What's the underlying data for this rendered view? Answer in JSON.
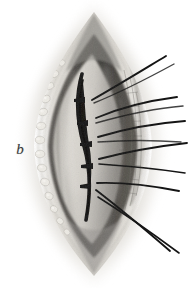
{
  "figure": {
    "kind": "medical-illustration",
    "technique": "monochrome halftone engraving",
    "panel_label": "b",
    "background_color": "#ffffff",
    "width": 188,
    "height": 288
  },
  "palette": {
    "background": "#ffffff",
    "thread_black": "#141414",
    "incision_dark": "#1c1c1c",
    "cavity_shadow": "#3b3a38",
    "tissue_mid": "#8e8c88",
    "tissue_light": "#d8d5cf",
    "tissue_highlight": "#f2f0ec",
    "fat_lobule": "#e9e6e0",
    "outer_fade": "#c9c6c0",
    "label_ink": "#3a3a3a"
  },
  "anatomy": {
    "wound_outline": {
      "name": "lens-shaped wound opening",
      "apex_top": [
        94,
        12
      ],
      "apex_bottom": [
        94,
        276
      ],
      "left_extreme": [
        34,
        144
      ],
      "right_extreme": [
        150,
        144
      ]
    },
    "regions": [
      {
        "name": "outer-skin-margin",
        "shade": "#d0cdc7",
        "note": "soft feathered halftone fading to white"
      },
      {
        "name": "subcutaneous-fat-left",
        "shade": "#e9e6e0",
        "note": "row of pale rounded lobules along left wound edge"
      },
      {
        "name": "fascia-right",
        "shade": "#a5a29c",
        "note": "vertically striated band on right edge pierced by sutures"
      },
      {
        "name": "wound-cavity",
        "shade": "#4a4846",
        "note": "dark recess deepest at superior pole"
      },
      {
        "name": "exposed-surface",
        "shade": "#cfccc6",
        "note": "smooth pale tissue plane filling centre"
      }
    ]
  },
  "incision": {
    "name": "approximated incision line",
    "start": [
      82,
      74
    ],
    "end": [
      86,
      220
    ],
    "max_width_px": 7,
    "color": "#1c1c1c"
  },
  "knots": [
    {
      "index": 1,
      "x": 79,
      "y": 100
    },
    {
      "index": 2,
      "x": 82,
      "y": 123
    },
    {
      "index": 3,
      "x": 86,
      "y": 144
    },
    {
      "index": 4,
      "x": 87,
      "y": 166
    },
    {
      "index": 5,
      "x": 85,
      "y": 186
    }
  ],
  "sutures": {
    "count": 11,
    "color": "#141414",
    "description": "interrupted suture strands drawn taut to the right of the wound",
    "strands": [
      {
        "id": 1,
        "from": [
          92,
          100
        ],
        "control": [
          128,
          78
        ],
        "to": [
          166,
          56
        ]
      },
      {
        "id": 2,
        "from": [
          94,
          102
        ],
        "control": [
          134,
          85
        ],
        "to": [
          172,
          65
        ]
      },
      {
        "id": 3,
        "from": [
          96,
          118
        ],
        "control": [
          132,
          104
        ],
        "to": [
          176,
          98
        ]
      },
      {
        "id": 4,
        "from": [
          96,
          122
        ],
        "control": [
          136,
          112
        ],
        "to": [
          182,
          106
        ]
      },
      {
        "id": 5,
        "from": [
          98,
          137
        ],
        "control": [
          138,
          128
        ],
        "to": [
          184,
          122
        ]
      },
      {
        "id": 6,
        "from": [
          98,
          142
        ],
        "control": [
          136,
          140
        ],
        "to": [
          180,
          142
        ]
      },
      {
        "id": 7,
        "from": [
          99,
          160
        ],
        "control": [
          140,
          152
        ],
        "to": [
          186,
          144
        ]
      },
      {
        "id": 8,
        "from": [
          99,
          164
        ],
        "control": [
          140,
          166
        ],
        "to": [
          184,
          172
        ]
      },
      {
        "id": 9,
        "from": [
          97,
          184
        ],
        "control": [
          136,
          182
        ],
        "to": [
          178,
          190
        ]
      },
      {
        "id": 10,
        "from": [
          96,
          190
        ],
        "control": [
          132,
          214
        ],
        "to": [
          170,
          250
        ]
      },
      {
        "id": 11,
        "from": [
          98,
          196
        ],
        "control": [
          138,
          222
        ],
        "to": [
          178,
          252
        ]
      }
    ]
  }
}
